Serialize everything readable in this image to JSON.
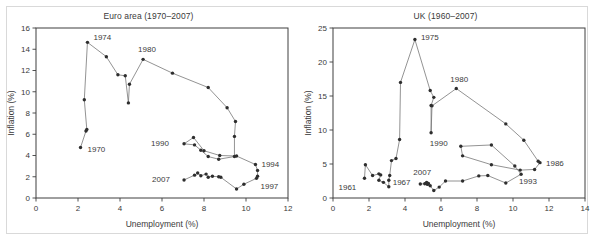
{
  "figure": {
    "background_color": "#ffffff",
    "frame_color": "#d9d9d9",
    "line_color": "#6f6f6f",
    "marker_color": "#2e2e2e",
    "axis_color": "#3f3f3f"
  },
  "chart_data": [
    {
      "type": "line",
      "panel": "left",
      "title": "Euro area (1970–2007)",
      "xlabel": "Unemployment (%)",
      "ylabel": "Inflation (%)",
      "xlim": [
        0,
        12
      ],
      "ylim": [
        0,
        16
      ],
      "xticks": [
        0,
        2,
        4,
        6,
        8,
        10,
        12
      ],
      "yticks": [
        0,
        2,
        4,
        6,
        8,
        10,
        12,
        14,
        16
      ],
      "grid": false,
      "legend": "none",
      "series": [
        {
          "name": "Euro area Phillips curve path",
          "points": [
            {
              "x": 2.12,
              "y": 4.75,
              "label": "1970"
            },
            {
              "x": 2.38,
              "y": 6.3
            },
            {
              "x": 2.42,
              "y": 6.45
            },
            {
              "x": 2.3,
              "y": 9.25
            },
            {
              "x": 2.45,
              "y": 14.65,
              "label": "1974"
            },
            {
              "x": 3.35,
              "y": 13.3
            },
            {
              "x": 3.9,
              "y": 11.6
            },
            {
              "x": 4.25,
              "y": 11.5
            },
            {
              "x": 4.4,
              "y": 8.95
            },
            {
              "x": 4.45,
              "y": 10.7
            },
            {
              "x": 5.1,
              "y": 13.05,
              "label": "1980"
            },
            {
              "x": 6.5,
              "y": 11.75
            },
            {
              "x": 8.2,
              "y": 10.4
            },
            {
              "x": 9.1,
              "y": 8.5
            },
            {
              "x": 9.5,
              "y": 7.2
            },
            {
              "x": 9.45,
              "y": 5.8
            },
            {
              "x": 9.45,
              "y": 3.9
            },
            {
              "x": 8.7,
              "y": 3.65
            },
            {
              "x": 8.2,
              "y": 3.9
            },
            {
              "x": 7.85,
              "y": 4.5
            },
            {
              "x": 7.55,
              "y": 5.0
            },
            {
              "x": 7.05,
              "y": 5.1,
              "label": "1990"
            },
            {
              "x": 7.5,
              "y": 5.7
            },
            {
              "x": 8.0,
              "y": 4.45
            },
            {
              "x": 8.75,
              "y": 4.0
            },
            {
              "x": 9.55,
              "y": 3.95
            },
            {
              "x": 10.45,
              "y": 3.15,
              "label": "1994"
            },
            {
              "x": 10.55,
              "y": 2.6
            },
            {
              "x": 10.55,
              "y": 2.05
            },
            {
              "x": 10.5,
              "y": 1.85,
              "label": "1997"
            },
            {
              "x": 9.9,
              "y": 1.3
            },
            {
              "x": 9.55,
              "y": 0.85
            },
            {
              "x": 8.8,
              "y": 1.95
            },
            {
              "x": 8.7,
              "y": 2.0
            },
            {
              "x": 8.4,
              "y": 2.05
            },
            {
              "x": 8.2,
              "y": 1.95
            },
            {
              "x": 8.1,
              "y": 2.25
            },
            {
              "x": 7.85,
              "y": 2.1
            },
            {
              "x": 7.7,
              "y": 2.35
            },
            {
              "x": 7.55,
              "y": 2.15
            },
            {
              "x": 7.05,
              "y": 1.7,
              "label": "2007"
            }
          ]
        }
      ],
      "annotations": [
        {
          "text": "1970",
          "x": 2.12,
          "y": 4.75,
          "dx": 7,
          "dy": 4
        },
        {
          "text": "1974",
          "x": 2.45,
          "y": 14.65,
          "dx": 6,
          "dy": -2
        },
        {
          "text": "1980",
          "x": 5.1,
          "y": 13.05,
          "dx": -5,
          "dy": -7
        },
        {
          "text": "1990",
          "x": 7.05,
          "y": 5.1,
          "dx": -33,
          "dy": 2
        },
        {
          "text": "1994",
          "x": 10.45,
          "y": 3.15,
          "dx": 6,
          "dy": 2
        },
        {
          "text": "1997",
          "x": 10.5,
          "y": 1.85,
          "dx": 4,
          "dy": 11
        },
        {
          "text": "2007",
          "x": 7.05,
          "y": 1.7,
          "dx": -32,
          "dy": 2
        }
      ]
    },
    {
      "type": "line",
      "panel": "right",
      "title": "UK (1960–2007)",
      "xlabel": "Unemployment (%)",
      "ylabel": "Inflation (%)",
      "xlim": [
        0,
        14
      ],
      "ylim": [
        0,
        25
      ],
      "xticks": [
        0,
        2,
        4,
        6,
        8,
        10,
        12,
        14
      ],
      "yticks": [
        0,
        5,
        10,
        15,
        20,
        25
      ],
      "grid": false,
      "legend": "none",
      "series": [
        {
          "name": "UK Phillips curve path",
          "points": [
            {
              "x": 1.75,
              "y": 2.9,
              "label": "1961"
            },
            {
              "x": 1.8,
              "y": 4.9
            },
            {
              "x": 2.2,
              "y": 3.3
            },
            {
              "x": 2.55,
              "y": 3.55
            },
            {
              "x": 2.65,
              "y": 3.4
            },
            {
              "x": 2.55,
              "y": 2.6
            },
            {
              "x": 2.8,
              "y": 2.3
            },
            {
              "x": 3.1,
              "y": 1.65
            },
            {
              "x": 3.1,
              "y": 2.6
            },
            {
              "x": 3.15,
              "y": 3.3,
              "label": "1967"
            },
            {
              "x": 3.25,
              "y": 5.5
            },
            {
              "x": 3.5,
              "y": 5.8
            },
            {
              "x": 3.7,
              "y": 8.6
            },
            {
              "x": 3.75,
              "y": 17.0
            },
            {
              "x": 4.55,
              "y": 23.3,
              "label": "1975"
            },
            {
              "x": 5.4,
              "y": 15.8
            },
            {
              "x": 5.6,
              "y": 14.8
            },
            {
              "x": 5.45,
              "y": 13.6
            },
            {
              "x": 5.45,
              "y": 9.6
            },
            {
              "x": 5.5,
              "y": 13.55
            },
            {
              "x": 6.85,
              "y": 16.1,
              "label": "1980"
            },
            {
              "x": 9.6,
              "y": 10.9
            },
            {
              "x": 10.6,
              "y": 8.5
            },
            {
              "x": 11.4,
              "y": 5.4
            },
            {
              "x": 11.5,
              "y": 5.2,
              "label": "1986"
            },
            {
              "x": 11.2,
              "y": 4.2
            },
            {
              "x": 10.4,
              "y": 4.1
            },
            {
              "x": 8.8,
              "y": 4.9
            },
            {
              "x": 7.2,
              "y": 6.2
            },
            {
              "x": 7.1,
              "y": 7.6,
              "label": "1990"
            },
            {
              "x": 8.8,
              "y": 7.8
            },
            {
              "x": 10.1,
              "y": 4.7
            },
            {
              "x": 10.45,
              "y": 3.5,
              "label": "1993"
            },
            {
              "x": 9.6,
              "y": 2.2
            },
            {
              "x": 8.6,
              "y": 3.3
            },
            {
              "x": 8.1,
              "y": 3.25
            },
            {
              "x": 7.2,
              "y": 2.5
            },
            {
              "x": 6.25,
              "y": 2.5
            },
            {
              "x": 5.9,
              "y": 1.6
            },
            {
              "x": 5.6,
              "y": 1.1
            },
            {
              "x": 5.4,
              "y": 1.8
            },
            {
              "x": 5.25,
              "y": 2.0
            },
            {
              "x": 5.1,
              "y": 2.1
            },
            {
              "x": 5.2,
              "y": 2.3
            },
            {
              "x": 5.3,
              "y": 2.15
            },
            {
              "x": 4.85,
              "y": 2.05,
              "label": "2007"
            }
          ]
        }
      ],
      "annotations": [
        {
          "text": "1961",
          "x": 1.75,
          "y": 2.9,
          "dx": -26,
          "dy": 12
        },
        {
          "text": "1967",
          "x": 3.15,
          "y": 3.3,
          "dx": 3,
          "dy": 9
        },
        {
          "text": "1975",
          "x": 4.55,
          "y": 23.3,
          "dx": 6,
          "dy": 0
        },
        {
          "text": "1980",
          "x": 6.85,
          "y": 16.1,
          "dx": -6,
          "dy": -7
        },
        {
          "text": "1986",
          "x": 11.5,
          "y": 5.2,
          "dx": 6,
          "dy": 3
        },
        {
          "text": "1990",
          "x": 7.1,
          "y": 7.6,
          "dx": -31,
          "dy": 0
        },
        {
          "text": "1993",
          "x": 10.45,
          "y": 3.5,
          "dx": -2,
          "dy": 10
        },
        {
          "text": "2007",
          "x": 4.85,
          "y": 2.05,
          "dx": -7,
          "dy": -9
        }
      ]
    }
  ]
}
